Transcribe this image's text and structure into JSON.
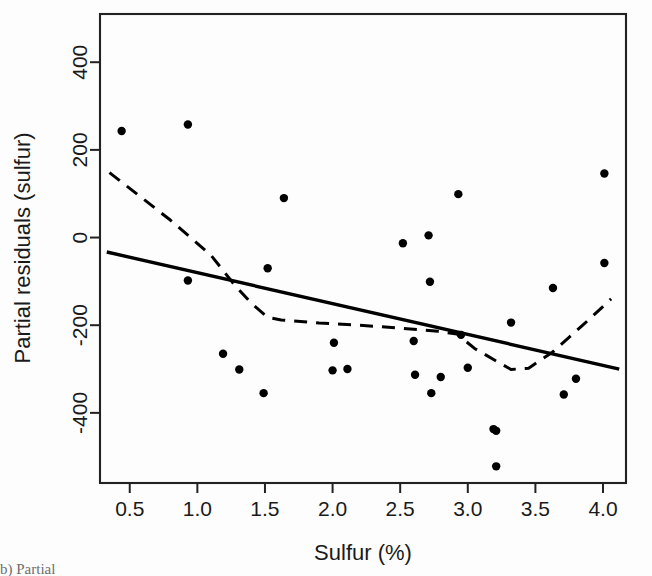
{
  "figure": {
    "background_color": "#fdfdfd",
    "frame_color": "#222222",
    "caption_fragment": "b) Partial"
  },
  "chart_data": {
    "type": "scatter",
    "title": "",
    "xlabel": "Sulfur (%)",
    "ylabel": "Partial residuals (sulfur)",
    "xlim": [
      0.28,
      4.17
    ],
    "ylim": [
      -560,
      510
    ],
    "grid": false,
    "legend": null,
    "xticks": [
      0.5,
      1.0,
      1.5,
      2.0,
      2.5,
      3.0,
      3.5,
      4.0
    ],
    "xticklabels": [
      "0.5",
      "1.0",
      "1.5",
      "2.0",
      "2.5",
      "3.0",
      "3.5",
      "4.0"
    ],
    "yticks": [
      400,
      200,
      0,
      -200,
      -400
    ],
    "yticklabels": [
      "400",
      "200",
      "0",
      "-200",
      "-400"
    ],
    "point_color": "#000000",
    "point_radius": 4.2,
    "points": [
      {
        "x": 0.44,
        "y": 243
      },
      {
        "x": 0.93,
        "y": 258
      },
      {
        "x": 0.93,
        "y": -98
      },
      {
        "x": 1.19,
        "y": -265
      },
      {
        "x": 1.31,
        "y": -301
      },
      {
        "x": 1.49,
        "y": -355
      },
      {
        "x": 1.52,
        "y": -70
      },
      {
        "x": 1.64,
        "y": 90
      },
      {
        "x": 2.0,
        "y": -303
      },
      {
        "x": 2.01,
        "y": -240
      },
      {
        "x": 2.11,
        "y": -300
      },
      {
        "x": 2.52,
        "y": -13
      },
      {
        "x": 2.6,
        "y": -236
      },
      {
        "x": 2.61,
        "y": -313
      },
      {
        "x": 2.71,
        "y": 5
      },
      {
        "x": 2.72,
        "y": -101
      },
      {
        "x": 2.73,
        "y": -355
      },
      {
        "x": 2.8,
        "y": -318
      },
      {
        "x": 2.93,
        "y": 99
      },
      {
        "x": 2.95,
        "y": -222
      },
      {
        "x": 3.0,
        "y": -297
      },
      {
        "x": 3.19,
        "y": -437
      },
      {
        "x": 3.21,
        "y": -441
      },
      {
        "x": 3.21,
        "y": -522
      },
      {
        "x": 3.32,
        "y": -194
      },
      {
        "x": 3.63,
        "y": -115
      },
      {
        "x": 3.71,
        "y": -358
      },
      {
        "x": 3.8,
        "y": -322
      },
      {
        "x": 4.01,
        "y": 146
      },
      {
        "x": 4.01,
        "y": -58
      }
    ],
    "series": [
      {
        "name": "linear-fit",
        "style": "solid",
        "color": "#000000",
        "width": 3.4,
        "x": [
          0.33,
          4.12
        ],
        "values": [
          -33,
          -300
        ]
      },
      {
        "name": "smoother",
        "style": "dashed",
        "color": "#000000",
        "width": 3.0,
        "x": [
          0.35,
          0.8,
          1.1,
          1.28,
          1.4,
          1.52,
          1.62,
          1.9,
          2.2,
          2.55,
          2.78,
          2.92,
          3.05,
          3.2,
          3.32,
          3.45,
          3.62,
          3.85,
          4.06
        ],
        "values": [
          148,
          40,
          -40,
          -110,
          -150,
          -182,
          -188,
          -195,
          -200,
          -208,
          -214,
          -220,
          -253,
          -280,
          -301,
          -298,
          -263,
          -200,
          -140
        ]
      }
    ]
  }
}
